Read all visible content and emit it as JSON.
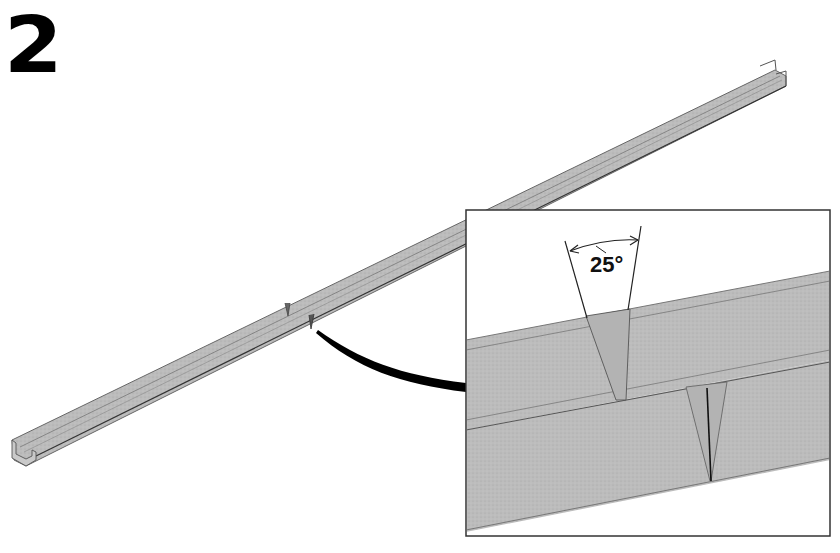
{
  "figure": {
    "step_number": "2",
    "detail_view": {
      "angle_label": "25°",
      "angle_degrees": 25
    },
    "colors": {
      "metal": "#bdbdbd",
      "metal_dark": "#a9a9a9",
      "outline": "#555555",
      "line": "#000000",
      "background": "#ffffff"
    }
  }
}
